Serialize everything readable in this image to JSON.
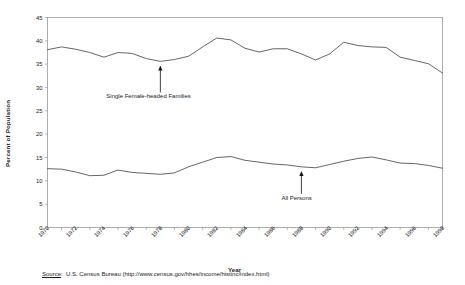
{
  "chart_data": {
    "type": "line",
    "title": "",
    "xlabel": "Year",
    "ylabel": "Percent of Population",
    "xlim": [
      1970,
      1998
    ],
    "ylim": [
      0,
      45
    ],
    "ytick_step": 5,
    "grid": false,
    "legend_position": "inline-annotations",
    "x": [
      1970,
      1971,
      1972,
      1973,
      1974,
      1975,
      1976,
      1977,
      1978,
      1979,
      1980,
      1981,
      1982,
      1983,
      1984,
      1985,
      1986,
      1987,
      1988,
      1989,
      1990,
      1991,
      1992,
      1993,
      1994,
      1995,
      1996,
      1997,
      1998
    ],
    "xticks": [
      "1970",
      "1972",
      "1974",
      "1976",
      "1978",
      "1980",
      "1982",
      "1984",
      "1986",
      "1988",
      "1990",
      "1992",
      "1994",
      "1996",
      "1998"
    ],
    "yticks": [
      "0",
      "5",
      "10",
      "15",
      "20",
      "25",
      "30",
      "35",
      "40",
      "45"
    ],
    "series": [
      {
        "name": "Single Female-headed Families",
        "values": [
          38.1,
          38.7,
          38.2,
          37.5,
          36.5,
          37.5,
          37.3,
          36.2,
          35.6,
          36.0,
          36.7,
          38.7,
          40.6,
          40.2,
          38.4,
          37.6,
          38.3,
          38.3,
          37.2,
          35.9,
          37.2,
          39.7,
          39.0,
          38.7,
          38.6,
          36.5,
          35.8,
          35.1,
          33.1
        ]
      },
      {
        "name": "All Persons",
        "values": [
          12.6,
          12.5,
          11.9,
          11.1,
          11.2,
          12.3,
          11.8,
          11.6,
          11.4,
          11.7,
          13.0,
          14.0,
          15.0,
          15.2,
          14.4,
          14.0,
          13.6,
          13.4,
          13.0,
          12.8,
          13.5,
          14.2,
          14.8,
          15.1,
          14.5,
          13.8,
          13.7,
          13.3,
          12.7
        ]
      }
    ],
    "annotations": [
      {
        "text": "Single Female-headed Families",
        "points_to_series": "Single Female-headed Families",
        "points_to_x": 1978
      },
      {
        "text": "All Persons",
        "points_to_series": "All Persons",
        "points_to_x": 1988
      }
    ]
  },
  "source": {
    "label": "Source",
    "separator": ":",
    "text": "U.S. Census Bureau (http://www.census.gov/hhes/income/histinc/index.html)"
  },
  "colors": {
    "line": "#4a4a4a",
    "axis": "#8a8a8a",
    "text": "#1a1a1a",
    "background": "#ffffff"
  }
}
